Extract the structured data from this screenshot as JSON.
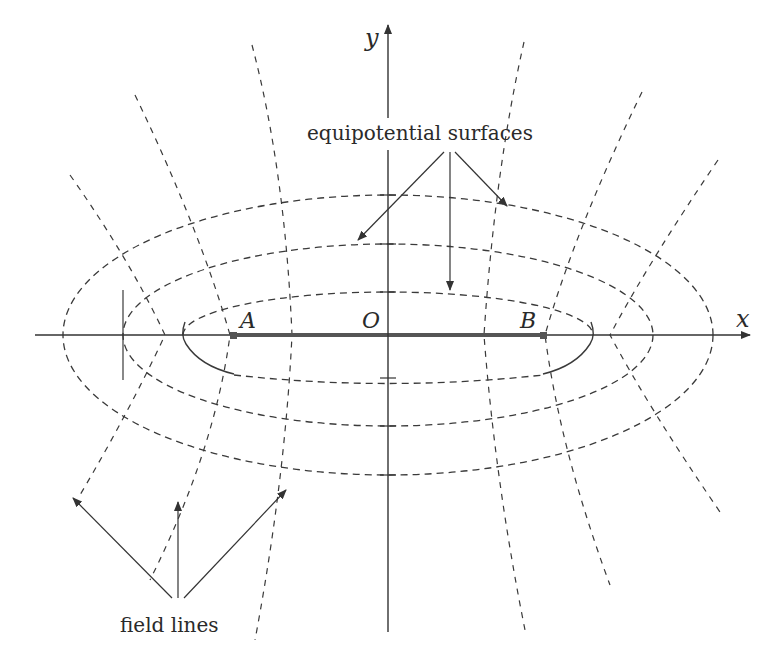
{
  "diagram": {
    "type": "electric field of a uniformly charged line segment",
    "axes": {
      "x_label": "x",
      "y_label": "y",
      "origin_label": "O"
    },
    "points": [
      {
        "label": "A",
        "role": "left end of charged segment"
      },
      {
        "label": "O",
        "role": "origin / midpoint"
      },
      {
        "label": "B",
        "role": "right end of charged segment"
      }
    ],
    "annotations": {
      "equipotential": "equipotential surfaces",
      "field_lines": "field lines"
    },
    "equipotential_count": 3,
    "field_line_count_per_side": 4,
    "colors": {
      "line": "#3a3a3a",
      "segment": "#555555",
      "background": "#ffffff"
    }
  }
}
